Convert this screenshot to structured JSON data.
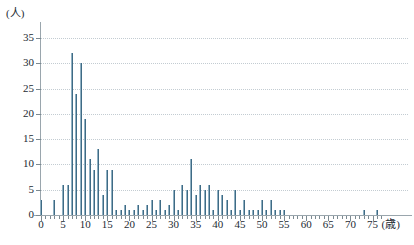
{
  "chart_data": {
    "type": "bar",
    "title": "",
    "subtitle": "",
    "xlabel": "(歳)",
    "ylabel": "(人)",
    "xlim": [
      -1,
      78
    ],
    "ylim": [
      0,
      35
    ],
    "grid": true,
    "legend": false,
    "legend_position": "none",
    "bar_color": "#3f6b85",
    "axis_color": "#9aa6ad",
    "grid_color": "#c3ccd2",
    "y_ticks": [
      0,
      5,
      10,
      15,
      20,
      25,
      30,
      35
    ],
    "x_ticks": [
      0,
      5,
      10,
      15,
      20,
      25,
      30,
      35,
      40,
      45,
      50,
      55,
      60,
      65,
      70,
      75
    ],
    "x_tick_labels": [
      "0",
      "5",
      "10",
      "15",
      "20",
      "25",
      "30",
      "35",
      "40",
      "45",
      "50",
      "55",
      "60",
      "65",
      "70",
      "75"
    ],
    "x_minor_tick_step": 1,
    "categories": [
      0,
      1,
      2,
      3,
      4,
      5,
      6,
      7,
      8,
      9,
      10,
      11,
      12,
      13,
      14,
      15,
      16,
      17,
      18,
      19,
      20,
      21,
      22,
      23,
      24,
      25,
      26,
      27,
      28,
      29,
      30,
      31,
      32,
      33,
      34,
      35,
      36,
      37,
      38,
      39,
      40,
      41,
      42,
      43,
      44,
      45,
      46,
      47,
      48,
      49,
      50,
      51,
      52,
      53,
      54,
      55,
      56,
      57,
      58,
      59,
      60,
      61,
      62,
      63,
      64,
      65,
      66,
      67,
      68,
      69,
      70,
      71,
      72,
      73,
      74,
      75,
      76,
      77
    ],
    "values": [
      3,
      0,
      0,
      3,
      0,
      6,
      6,
      32,
      24,
      30,
      19,
      11,
      9,
      13,
      4,
      9,
      9,
      1,
      1,
      2,
      1,
      1,
      2,
      1,
      2,
      3,
      1,
      3,
      1,
      2,
      5,
      1,
      6,
      5,
      11,
      4,
      6,
      5,
      6,
      1,
      5,
      4,
      3,
      1,
      5,
      1,
      3,
      1,
      1,
      1,
      3,
      1,
      3,
      1,
      1,
      1,
      0,
      0,
      0,
      0,
      0,
      0,
      0,
      0,
      0,
      0,
      0,
      0,
      0,
      0,
      0,
      0,
      0,
      1,
      0,
      0,
      1,
      0
    ],
    "series_name": "年齢別人数"
  },
  "axes": {
    "y_unit_label": "(人)",
    "x_unit_label": "(歳)"
  }
}
